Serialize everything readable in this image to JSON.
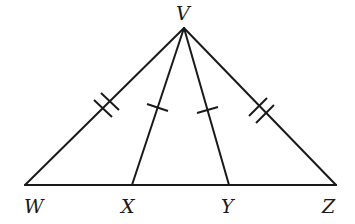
{
  "diagram": {
    "points": {
      "V": {
        "label": "V",
        "x": 184,
        "y": 28,
        "label_x": 176,
        "label_y": 20
      },
      "W": {
        "label": "W",
        "x": 25,
        "y": 185,
        "label_x": 24,
        "label_y": 213
      },
      "X": {
        "label": "X",
        "x": 132,
        "y": 185,
        "label_x": 121,
        "label_y": 213
      },
      "Y": {
        "label": "Y",
        "x": 229,
        "y": 185,
        "label_x": 221,
        "label_y": 213
      },
      "Z": {
        "label": "Z",
        "x": 336,
        "y": 185,
        "label_x": 322,
        "label_y": 213
      }
    },
    "segments": [
      {
        "from": "V",
        "to": "W",
        "ticks": 2
      },
      {
        "from": "V",
        "to": "X",
        "ticks": 1
      },
      {
        "from": "V",
        "to": "Y",
        "ticks": 1
      },
      {
        "from": "V",
        "to": "Z",
        "ticks": 2
      },
      {
        "from": "W",
        "to": "Z",
        "ticks": 0
      }
    ],
    "congruence": [
      "VW ≅ VZ (double tick marks)",
      "VX ≅ VY (single tick marks)"
    ],
    "stroke_color": "#1a1a1a",
    "background": "#ffffff"
  }
}
